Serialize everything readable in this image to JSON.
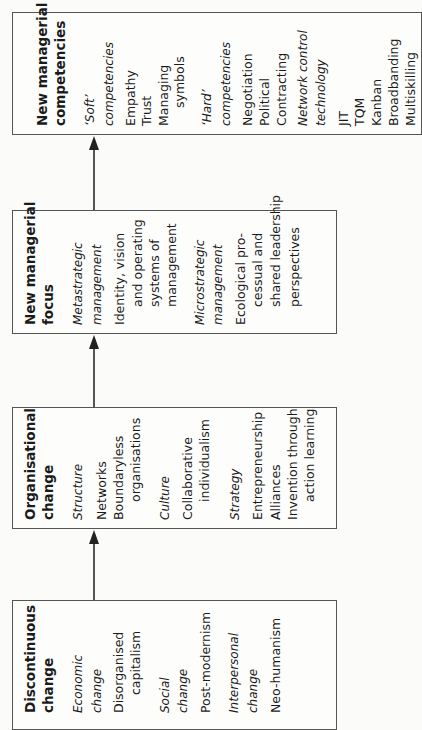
{
  "diagram": {
    "boxes": [
      {
        "id": "competencies",
        "rect": {
          "left": 12,
          "top": 12,
          "width": 410,
          "height": 123
        },
        "lines": [
          {
            "text": "New managerial",
            "style": "title",
            "x": 22,
            "indent": 0
          },
          {
            "text": "competencies",
            "style": "title",
            "x": 40,
            "indent": 0
          },
          {
            "text": "‘Soft’",
            "style": "ital",
            "x": 70,
            "indent": 0
          },
          {
            "text": "competencies",
            "style": "ital",
            "x": 89,
            "indent": 0
          },
          {
            "text": "Empathy",
            "style": "normal",
            "x": 111,
            "indent": 0
          },
          {
            "text": "Trust",
            "style": "normal",
            "x": 127,
            "indent": 0
          },
          {
            "text": "Managing",
            "style": "normal",
            "x": 144,
            "indent": 0
          },
          {
            "text": "symbols",
            "style": "normal",
            "x": 160,
            "indent": 18
          },
          {
            "text": "‘Hard’",
            "style": "ital",
            "x": 187,
            "indent": 0
          },
          {
            "text": "competencies",
            "style": "ital",
            "x": 206,
            "indent": 0
          },
          {
            "text": "Negotiation",
            "style": "normal",
            "x": 228,
            "indent": 0
          },
          {
            "text": "Political",
            "style": "normal",
            "x": 245,
            "indent": 0
          },
          {
            "text": "Contracting",
            "style": "normal",
            "x": 262,
            "indent": 0
          },
          {
            "text": "Network control",
            "style": "ital",
            "x": 283,
            "indent": 0
          },
          {
            "text": "technology",
            "style": "ital",
            "x": 301,
            "indent": 0
          },
          {
            "text": "JIT",
            "style": "normal",
            "x": 324,
            "indent": 0
          },
          {
            "text": "TQM",
            "style": "normal",
            "x": 340,
            "indent": 0
          },
          {
            "text": "Kanban",
            "style": "normal",
            "x": 357,
            "indent": 0
          },
          {
            "text": "Broadbanding",
            "style": "normal",
            "x": 374,
            "indent": 0
          },
          {
            "text": "Multiskilling",
            "style": "normal",
            "x": 391,
            "indent": 0
          }
        ]
      },
      {
        "id": "focus",
        "rect": {
          "left": 12,
          "top": 210,
          "width": 325,
          "height": 124
        },
        "lines": [
          {
            "text": "New managerial",
            "style": "title",
            "x": 10,
            "indent": 0
          },
          {
            "text": "focus",
            "style": "title",
            "x": 28,
            "indent": 0
          },
          {
            "text": "Metastrategic",
            "style": "ital",
            "x": 58,
            "indent": 0
          },
          {
            "text": "management",
            "style": "ital",
            "x": 77,
            "indent": 0
          },
          {
            "text": "Identity, vision",
            "style": "normal",
            "x": 100,
            "indent": 0
          },
          {
            "text": "and operating",
            "style": "normal",
            "x": 118,
            "indent": 18
          },
          {
            "text": "systems of",
            "style": "normal",
            "x": 135,
            "indent": 18
          },
          {
            "text": "management",
            "style": "normal",
            "x": 152,
            "indent": 18
          },
          {
            "text": "Microstrategic",
            "style": "ital",
            "x": 180,
            "indent": 0
          },
          {
            "text": "management",
            "style": "ital",
            "x": 198,
            "indent": 0
          },
          {
            "text": "Ecological pro-",
            "style": "normal",
            "x": 221,
            "indent": 0
          },
          {
            "text": "cessual and",
            "style": "normal",
            "x": 238,
            "indent": 18
          },
          {
            "text": "shared leadership",
            "style": "normal",
            "x": 256,
            "indent": 18
          },
          {
            "text": "perspectives",
            "style": "normal",
            "x": 275,
            "indent": 18
          }
        ]
      },
      {
        "id": "organisational",
        "rect": {
          "left": 12,
          "top": 407,
          "width": 325,
          "height": 122
        },
        "lines": [
          {
            "text": "Organisational",
            "style": "title",
            "x": 10,
            "indent": 0
          },
          {
            "text": "change",
            "style": "title",
            "x": 28,
            "indent": 0
          },
          {
            "text": "Structure",
            "style": "ital",
            "x": 58,
            "indent": 0
          },
          {
            "text": "Networks",
            "style": "normal",
            "x": 82,
            "indent": 0
          },
          {
            "text": "Boundaryless",
            "style": "normal",
            "x": 99,
            "indent": 0
          },
          {
            "text": "organisations",
            "style": "normal",
            "x": 116,
            "indent": 18
          },
          {
            "text": "Culture",
            "style": "ital",
            "x": 145,
            "indent": 0
          },
          {
            "text": "Collaborative",
            "style": "normal",
            "x": 168,
            "indent": 0
          },
          {
            "text": "individualism",
            "style": "normal",
            "x": 185,
            "indent": 18
          },
          {
            "text": "Strategy",
            "style": "ital",
            "x": 215,
            "indent": 0
          },
          {
            "text": "Entrepreneurship",
            "style": "normal",
            "x": 238,
            "indent": 0
          },
          {
            "text": "Alliances",
            "style": "normal",
            "x": 256,
            "indent": 0
          },
          {
            "text": "Invention through",
            "style": "normal",
            "x": 273,
            "indent": 0
          },
          {
            "text": "action learning",
            "style": "normal",
            "x": 290,
            "indent": 18
          }
        ]
      },
      {
        "id": "discontinuous",
        "rect": {
          "left": 12,
          "top": 600,
          "width": 325,
          "height": 130
        },
        "lines": [
          {
            "text": "Discontinuous",
            "style": "title",
            "x": 10,
            "indent": 0
          },
          {
            "text": "change",
            "style": "title",
            "x": 28,
            "indent": 0
          },
          {
            "text": "Economic",
            "style": "ital",
            "x": 58,
            "indent": 0
          },
          {
            "text": "change",
            "style": "ital",
            "x": 77,
            "indent": 0
          },
          {
            "text": "Disorganised",
            "style": "normal",
            "x": 99,
            "indent": 0
          },
          {
            "text": "capitalism",
            "style": "normal",
            "x": 116,
            "indent": 18
          },
          {
            "text": "Social",
            "style": "ital",
            "x": 145,
            "indent": 0
          },
          {
            "text": "change",
            "style": "ital",
            "x": 163,
            "indent": 0
          },
          {
            "text": "Post-modernism",
            "style": "normal",
            "x": 186,
            "indent": 0
          },
          {
            "text": "Interpersonal",
            "style": "ital",
            "x": 214,
            "indent": 0
          },
          {
            "text": "change",
            "style": "ital",
            "x": 233,
            "indent": 0
          },
          {
            "text": "Neo-humanism",
            "style": "normal",
            "x": 256,
            "indent": 0
          }
        ],
        "bottom_pad": 18
      }
    ],
    "arrows": [
      {
        "from": "discontinuous",
        "to": "organisational",
        "x": 94,
        "y1": 600,
        "y2": 529
      },
      {
        "from": "organisational",
        "to": "focus",
        "x": 94,
        "y1": 407,
        "y2": 334
      },
      {
        "from": "focus",
        "to": "competencies",
        "x": 94,
        "y1": 210,
        "y2": 135
      }
    ]
  }
}
